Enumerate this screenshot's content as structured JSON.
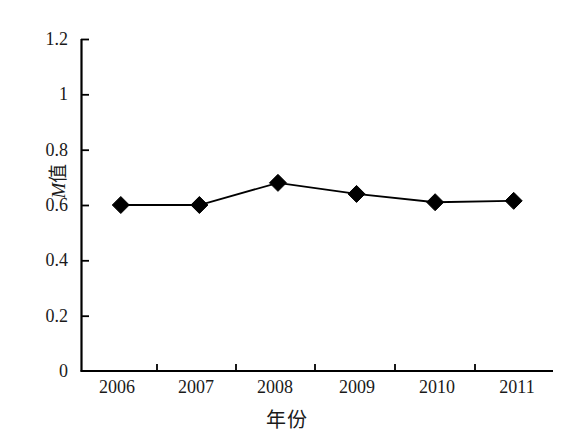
{
  "chart_data": {
    "type": "line",
    "title": "",
    "xlabel": "年份",
    "ylabel": "M值",
    "ylabel_italic_part": "M",
    "ylabel_plain_part": "值",
    "categories": [
      "2006",
      "2007",
      "2008",
      "2009",
      "2010",
      "2011"
    ],
    "values": [
      0.6,
      0.6,
      0.68,
      0.64,
      0.61,
      0.615
    ],
    "series": [
      {
        "name": "M值",
        "values": [
          0.6,
          0.6,
          0.68,
          0.64,
          0.61,
          0.615
        ],
        "marker": "diamond",
        "marker_color": "#000000",
        "line_color": "#000000"
      }
    ],
    "ylim": [
      0,
      1.2
    ],
    "yticks": [
      "0",
      "0.2",
      "0.4",
      "0.6",
      "0.8",
      "1",
      "1.2"
    ],
    "ytick_values": [
      0,
      0.2,
      0.4,
      0.6,
      0.8,
      1,
      1.2
    ],
    "xticks": [
      "2006",
      "2007",
      "2008",
      "2009",
      "2010",
      "2011"
    ],
    "grid": false,
    "legend": false,
    "legend_position": "none",
    "axis_color": "#000000",
    "background": "#ffffff"
  },
  "axis_titles": {
    "x": "年份",
    "y_italic": "M",
    "y_plain": "值"
  },
  "ytick_labels": {
    "t0": "0",
    "t1": "0.2",
    "t2": "0.4",
    "t3": "0.6",
    "t4": "0.8",
    "t5": "1",
    "t6": "1.2"
  },
  "xtick_labels": {
    "t0": "2006",
    "t1": "2007",
    "t2": "2008",
    "t3": "2009",
    "t4": "2010",
    "t5": "2011"
  }
}
